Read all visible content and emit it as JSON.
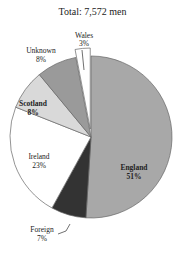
{
  "chart_data": {
    "type": "pie",
    "title": "Total: 7,572 men",
    "total": 7572,
    "unit": "men",
    "start_angle": "12 o'clock, clockwise",
    "slices": [
      {
        "label": "England",
        "percent": 51,
        "color": "#a8a8a8",
        "label_weight": "bold",
        "exploded": false
      },
      {
        "label": "Foreign",
        "percent": 7,
        "color": "#333333",
        "label_weight": "normal",
        "exploded": false
      },
      {
        "label": "Ireland",
        "percent": 23,
        "color": "#ffffff",
        "label_weight": "normal",
        "exploded": false
      },
      {
        "label": "Scotland",
        "percent": 8,
        "color": "#d9d9d9",
        "label_weight": "bold",
        "exploded": false
      },
      {
        "label": "Unknown",
        "percent": 8,
        "color": "#9a9a9a",
        "label_weight": "normal",
        "exploded": false
      },
      {
        "label": "Wales",
        "percent": 3,
        "color": "#ffffff",
        "label_weight": "normal",
        "exploded": true
      }
    ],
    "legend": "none (labels on/near slices)"
  },
  "labels": {
    "title": "Total: 7,572 men",
    "england": "England",
    "england_pct": "51%",
    "foreign": "Foreign",
    "foreign_pct": "7%",
    "ireland": "Ireland",
    "ireland_pct": "23%",
    "scotland": "Scotland",
    "scotland_pct": "8%",
    "unknown": "Unknown",
    "unknown_pct": "8%",
    "wales": "Wales",
    "wales_pct": "3%"
  }
}
